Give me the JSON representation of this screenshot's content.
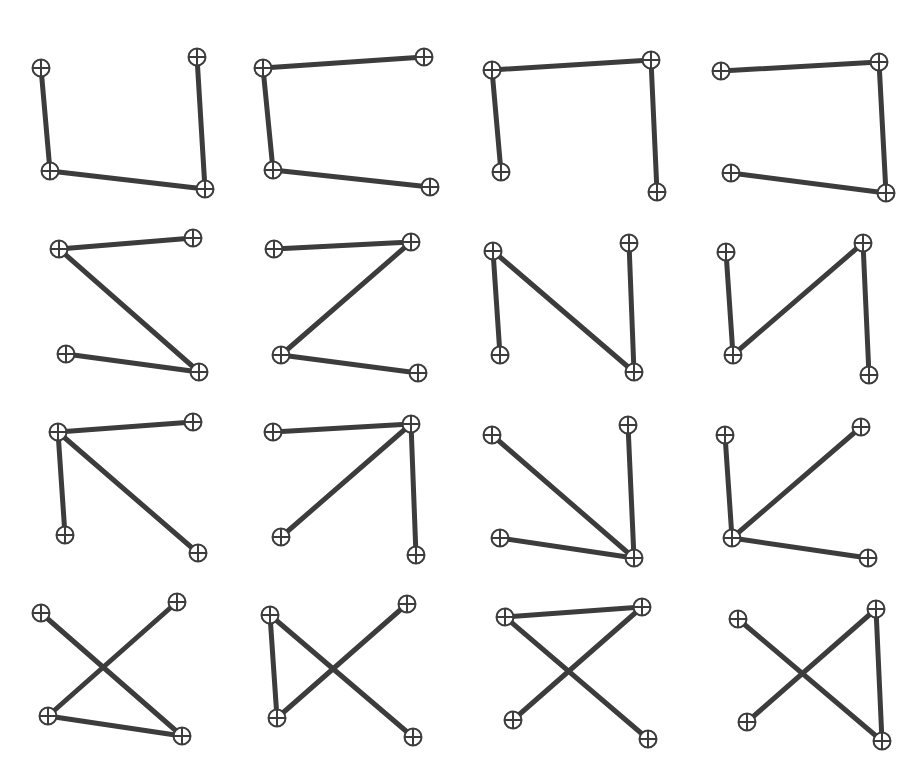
{
  "figure": {
    "background_color": "#ffffff",
    "width": 923,
    "height": 781,
    "grid_rows": 4,
    "grid_cols": 4,
    "panel_count": 16
  },
  "style": {
    "edge_color": "#3c3c3c",
    "edge_width": 5.0,
    "node_stroke_color": "#3c3c3c",
    "node_fill_color": "#ffffff",
    "node_stroke_width": 2.0,
    "node_radius": 8.5,
    "node_glyph": "circled-plus-marker",
    "node_cross_width": 2.0
  },
  "chart_data": {
    "type": "scatter",
    "subtitle": "",
    "xlabel": "",
    "ylabel": "",
    "grid": false,
    "legend": "none",
    "node_labels": [
      "TL",
      "TR",
      "BL",
      "BR"
    ],
    "panels": [
      {
        "index": 0,
        "row": 0,
        "col": 0,
        "shape_name": "u-bracket",
        "nodes": [
          {
            "id": "TL",
            "x": 41,
            "y": 68
          },
          {
            "id": "TR",
            "x": 197,
            "y": 57
          },
          {
            "id": "BL",
            "x": 50,
            "y": 171
          },
          {
            "id": "BR",
            "x": 205,
            "y": 189
          }
        ],
        "edges": [
          [
            "TL",
            "BL"
          ],
          [
            "BL",
            "BR"
          ],
          [
            "BR",
            "TR"
          ]
        ]
      },
      {
        "index": 1,
        "row": 0,
        "col": 1,
        "shape_name": "c-bracket",
        "nodes": [
          {
            "id": "TL",
            "x": 263,
            "y": 68
          },
          {
            "id": "TR",
            "x": 424,
            "y": 57
          },
          {
            "id": "BL",
            "x": 273,
            "y": 170
          },
          {
            "id": "BR",
            "x": 430,
            "y": 187
          }
        ],
        "edges": [
          [
            "TR",
            "TL"
          ],
          [
            "TL",
            "BL"
          ],
          [
            "BL",
            "BR"
          ]
        ]
      },
      {
        "index": 2,
        "row": 0,
        "col": 2,
        "shape_name": "n-arch",
        "nodes": [
          {
            "id": "TL",
            "x": 492,
            "y": 70
          },
          {
            "id": "TR",
            "x": 651,
            "y": 60
          },
          {
            "id": "BL",
            "x": 501,
            "y": 172
          },
          {
            "id": "BR",
            "x": 657,
            "y": 192
          }
        ],
        "edges": [
          [
            "BL",
            "TL"
          ],
          [
            "TL",
            "TR"
          ],
          [
            "TR",
            "BR"
          ]
        ]
      },
      {
        "index": 3,
        "row": 0,
        "col": 3,
        "shape_name": "reverse-c-bracket",
        "nodes": [
          {
            "id": "TL",
            "x": 721,
            "y": 71
          },
          {
            "id": "TR",
            "x": 879,
            "y": 62
          },
          {
            "id": "BL",
            "x": 731,
            "y": 173
          },
          {
            "id": "BR",
            "x": 886,
            "y": 193
          }
        ],
        "edges": [
          [
            "TL",
            "TR"
          ],
          [
            "TR",
            "BR"
          ],
          [
            "BR",
            "BL"
          ]
        ]
      },
      {
        "index": 4,
        "row": 1,
        "col": 0,
        "shape_name": "z-zigzag",
        "nodes": [
          {
            "id": "TL",
            "x": 59,
            "y": 249
          },
          {
            "id": "TR",
            "x": 193,
            "y": 238
          },
          {
            "id": "BL",
            "x": 66,
            "y": 354
          },
          {
            "id": "BR",
            "x": 199,
            "y": 372
          }
        ],
        "edges": [
          [
            "TR",
            "TL"
          ],
          [
            "TL",
            "BR"
          ],
          [
            "BR",
            "BL"
          ]
        ]
      },
      {
        "index": 5,
        "row": 1,
        "col": 1,
        "shape_name": "z-zigzag",
        "nodes": [
          {
            "id": "TL",
            "x": 274,
            "y": 249
          },
          {
            "id": "TR",
            "x": 411,
            "y": 242
          },
          {
            "id": "BL",
            "x": 281,
            "y": 355
          },
          {
            "id": "BR",
            "x": 418,
            "y": 373
          }
        ],
        "edges": [
          [
            "TL",
            "TR"
          ],
          [
            "TR",
            "BL"
          ],
          [
            "BL",
            "BR"
          ]
        ]
      },
      {
        "index": 6,
        "row": 1,
        "col": 2,
        "shape_name": "n-zigzag",
        "nodes": [
          {
            "id": "TL",
            "x": 493,
            "y": 251
          },
          {
            "id": "TR",
            "x": 629,
            "y": 243
          },
          {
            "id": "BL",
            "x": 500,
            "y": 355
          },
          {
            "id": "BR",
            "x": 634,
            "y": 372
          }
        ],
        "edges": [
          [
            "BL",
            "TL"
          ],
          [
            "TL",
            "BR"
          ],
          [
            "BR",
            "TR"
          ]
        ]
      },
      {
        "index": 7,
        "row": 1,
        "col": 3,
        "shape_name": "n-zigzag",
        "nodes": [
          {
            "id": "TL",
            "x": 726,
            "y": 252
          },
          {
            "id": "TR",
            "x": 863,
            "y": 243
          },
          {
            "id": "BL",
            "x": 733,
            "y": 355
          },
          {
            "id": "BR",
            "x": 869,
            "y": 375
          }
        ],
        "edges": [
          [
            "TL",
            "BL"
          ],
          [
            "BL",
            "TR"
          ],
          [
            "TR",
            "BR"
          ]
        ]
      },
      {
        "index": 8,
        "row": 2,
        "col": 0,
        "shape_name": "star-hub-top-left",
        "nodes": [
          {
            "id": "TL",
            "x": 58,
            "y": 432
          },
          {
            "id": "TR",
            "x": 193,
            "y": 422
          },
          {
            "id": "BL",
            "x": 65,
            "y": 535
          },
          {
            "id": "BR",
            "x": 198,
            "y": 553
          }
        ],
        "edges": [
          [
            "TL",
            "TR"
          ],
          [
            "TL",
            "BL"
          ],
          [
            "TL",
            "BR"
          ]
        ]
      },
      {
        "index": 9,
        "row": 2,
        "col": 1,
        "shape_name": "star-hub-top-right",
        "nodes": [
          {
            "id": "TL",
            "x": 273,
            "y": 432
          },
          {
            "id": "TR",
            "x": 411,
            "y": 424
          },
          {
            "id": "BL",
            "x": 281,
            "y": 537
          },
          {
            "id": "BR",
            "x": 416,
            "y": 555
          }
        ],
        "edges": [
          [
            "TR",
            "TL"
          ],
          [
            "TR",
            "BL"
          ],
          [
            "TR",
            "BR"
          ]
        ]
      },
      {
        "index": 10,
        "row": 2,
        "col": 2,
        "shape_name": "star-hub-bottom-right",
        "nodes": [
          {
            "id": "TL",
            "x": 492,
            "y": 435
          },
          {
            "id": "TR",
            "x": 628,
            "y": 425
          },
          {
            "id": "BL",
            "x": 500,
            "y": 538
          },
          {
            "id": "BR",
            "x": 634,
            "y": 558
          }
        ],
        "edges": [
          [
            "BR",
            "TL"
          ],
          [
            "BR",
            "TR"
          ],
          [
            "BR",
            "BL"
          ]
        ]
      },
      {
        "index": 11,
        "row": 2,
        "col": 3,
        "shape_name": "star-hub-bottom-left",
        "nodes": [
          {
            "id": "TL",
            "x": 725,
            "y": 435
          },
          {
            "id": "TR",
            "x": 861,
            "y": 427
          },
          {
            "id": "BL",
            "x": 732,
            "y": 538
          },
          {
            "id": "BR",
            "x": 868,
            "y": 558
          }
        ],
        "edges": [
          [
            "BL",
            "TL"
          ],
          [
            "BL",
            "TR"
          ],
          [
            "BL",
            "BR"
          ]
        ]
      },
      {
        "index": 12,
        "row": 3,
        "col": 0,
        "shape_name": "cross-with-bottom-bar",
        "nodes": [
          {
            "id": "TL",
            "x": 41,
            "y": 613
          },
          {
            "id": "TR",
            "x": 177,
            "y": 602
          },
          {
            "id": "BL",
            "x": 48,
            "y": 716
          },
          {
            "id": "BR",
            "x": 182,
            "y": 736
          }
        ],
        "edges": [
          [
            "TL",
            "BR"
          ],
          [
            "TR",
            "BL"
          ],
          [
            "BL",
            "BR"
          ]
        ]
      },
      {
        "index": 13,
        "row": 3,
        "col": 1,
        "shape_name": "cross-with-left-bar",
        "nodes": [
          {
            "id": "TL",
            "x": 270,
            "y": 615
          },
          {
            "id": "TR",
            "x": 407,
            "y": 604
          },
          {
            "id": "BL",
            "x": 277,
            "y": 718
          },
          {
            "id": "BR",
            "x": 413,
            "y": 737
          }
        ],
        "edges": [
          [
            "TL",
            "BR"
          ],
          [
            "TR",
            "BL"
          ],
          [
            "TL",
            "BL"
          ]
        ]
      },
      {
        "index": 14,
        "row": 3,
        "col": 2,
        "shape_name": "cross-with-top-bar",
        "nodes": [
          {
            "id": "TL",
            "x": 505,
            "y": 617
          },
          {
            "id": "TR",
            "x": 642,
            "y": 607
          },
          {
            "id": "BL",
            "x": 513,
            "y": 720
          },
          {
            "id": "BR",
            "x": 648,
            "y": 739
          }
        ],
        "edges": [
          [
            "TL",
            "TR"
          ],
          [
            "TL",
            "BR"
          ],
          [
            "TR",
            "BL"
          ]
        ]
      },
      {
        "index": 15,
        "row": 3,
        "col": 3,
        "shape_name": "cross-with-right-bar",
        "nodes": [
          {
            "id": "TL",
            "x": 738,
            "y": 619
          },
          {
            "id": "TR",
            "x": 876,
            "y": 609
          },
          {
            "id": "BL",
            "x": 747,
            "y": 722
          },
          {
            "id": "BR",
            "x": 882,
            "y": 741
          }
        ],
        "edges": [
          [
            "TL",
            "BR"
          ],
          [
            "TR",
            "BL"
          ],
          [
            "TR",
            "BR"
          ]
        ]
      }
    ]
  }
}
